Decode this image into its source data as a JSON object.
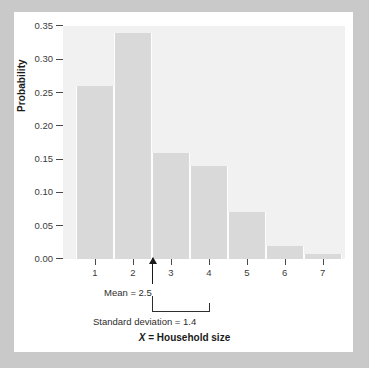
{
  "chart_data": {
    "type": "bar",
    "title": "",
    "xlabel": "X = Household size",
    "ylabel": "Probability",
    "categories": [
      "1",
      "2",
      "3",
      "4",
      "5",
      "6",
      "7"
    ],
    "values": [
      0.26,
      0.34,
      0.16,
      0.14,
      0.07,
      0.02,
      0.007
    ],
    "ylim": [
      0.0,
      0.35
    ],
    "ytick_labels": [
      "0.35",
      "0.30",
      "0.25",
      "0.20",
      "0.15",
      "0.10",
      "0.05",
      "0.00"
    ],
    "ytick_values": [
      0.35,
      0.3,
      0.25,
      0.2,
      0.15,
      0.1,
      0.05,
      0.0
    ],
    "grid": false,
    "legend": "none",
    "annotations": [
      {
        "name": "mean",
        "text": "Mean = 2.5",
        "value": 2.5
      },
      {
        "name": "standard-deviation",
        "text": "Standard deviation = 1.4",
        "value": 1.4,
        "span": [
          2.5,
          3.9
        ]
      }
    ],
    "colors": {
      "bar_fill": "#d9d9d9",
      "plot_background": "#f1f1f1",
      "card_background": "#ffffff",
      "page_background": "#c9c9c9",
      "axis": "#4a4a4a",
      "text": "#2e2e2e"
    }
  },
  "axis_titles": {
    "y": "Probability",
    "x_variable": "X",
    "x_rest": " = Household size"
  },
  "annotation_text": {
    "mean": "Mean = 2.5",
    "std": "Standard deviation = 1.4"
  }
}
